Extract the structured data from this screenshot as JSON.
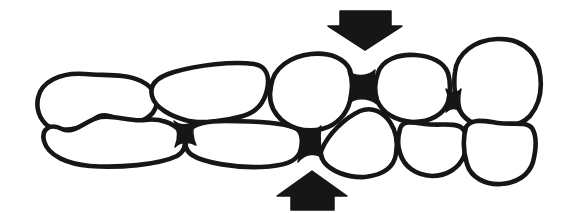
{
  "figure": {
    "background_color": "#ffffff",
    "ink_color": "#161616",
    "stroke_width": 4.6
  },
  "cells": {
    "t1": {
      "d": "M 38,98 C 41,82 60,72 85,74 C 103,76 124,73 141,81 C 155,88 160,99 155,109 C 151,118 139,124 126,121 C 113,119 105,110 93,120 C 81,130 60,133 48,126 C 39,119 36,108 38,98 Z"
    },
    "t2": {
      "d": "M 152,96 C 149,85 157,77 174,72 C 198,65 233,61 254,64 C 267,66 270,77 267,90 C 264,103 257,112 243,116 C 222,122 199,124 185,120 C 171,116 155,108 152,96 Z"
    },
    "t3": {
      "d": "M 271,86 C 273,68 291,56 311,54 C 331,52 345,59 350,70 C 353,80 352,92 350,101 C 347,113 338,125 322,129 C 305,133 287,128 277,115 C 269,105 269,95 271,86 Z"
    },
    "t4": {
      "d": "M 378,73 C 382,60 398,54 415,55 C 431,56 444,62 448,73 C 451,83 450,94 448,102 C 444,114 431,122 413,122 C 396,121 382,113 377,100 C 374,90 375,81 378,73 Z"
    },
    "t5": {
      "d": "M 455,72 C 457,53 475,40 497,39 C 518,38 535,49 539,68 C 543,87 540,104 530,116 C 518,128 497,131 480,126 C 464,121 456,109 455,93 C 454,85 454,79 455,72 Z"
    },
    "b1": {
      "d": "M 44,141 C 41,129 50,123 62,129 C 74,135 87,119 101,117 C 116,115 130,122 145,120 C 160,118 173,123 180,131 C 187,139 187,150 177,156 C 158,165 119,168 90,166 C 68,164 48,156 44,141 Z"
    },
    "b2": {
      "d": "M 189,131 C 193,124 206,121 226,121 C 249,121 281,122 295,128 C 303,131 303,142 300,152 C 296,162 284,166 261,167 C 237,168 204,163 192,155 C 183,149 185,139 189,131 Z"
    },
    "b3": {
      "d": "M 322,149 C 328,135 343,119 360,111 C 372,106 383,112 390,122 C 396,131 398,143 396,154 C 394,167 383,175 365,177 C 347,178 331,171 324,162 C 320,156 320,153 322,149 Z"
    },
    "b4": {
      "d": "M 400,129 C 402,120 412,122 425,124 C 440,126 455,122 462,128 C 468,134 468,146 464,156 C 459,168 447,176 432,176 C 416,175 404,167 400,153 C 397,144 398,136 400,129 Z"
    },
    "b5": {
      "d": "M 466,127 C 472,118 484,121 498,123 C 512,125 526,121 532,128 C 537,136 536,150 533,162 C 529,175 517,183 501,184 C 486,185 471,178 467,164 C 463,151 463,138 466,127 Z"
    }
  },
  "junctions": {
    "j1": {
      "d": "M 174,121 C 180,126 188,126 194,121 C 192,130 192,137 196,145 C 188,141 180,142 175,147 C 179,138 178,129 174,121 Z"
    },
    "j2": {
      "d": "M 348,71 C 355,77 368,77 375,70 C 373,82 373,93 377,104 C 368,97 355,97 348,104 C 352,93 352,82 348,71 Z"
    },
    "j3": {
      "d": "M 297,127 C 304,134 314,134 321,126 C 319,138 320,148 324,159 C 316,152 305,153 298,162 C 303,150 302,138 297,127 Z"
    },
    "j4": {
      "d": "M 446,89 C 451,94 457,94 461,89 C 459,97 459,104 462,112 C 456,107 451,107 446,112 C 449,104 449,96 446,89 Z"
    }
  },
  "arrows": {
    "top": {
      "name": "compression-arrow-down",
      "points": "340,11 391,11 391,26 402,26 365,50 328,26 340,26"
    },
    "bottom": {
      "name": "compression-arrow-up",
      "points": "312,171 347,196 334,196 334,210 291,210 291,196 277,196"
    }
  }
}
